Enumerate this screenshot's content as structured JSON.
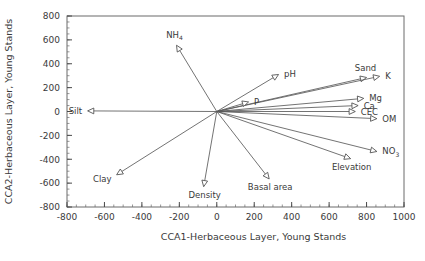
{
  "chart_data": {
    "type": "scatter",
    "title": "",
    "xlabel": "CCA1-Herbaceous Layer, Young Stands",
    "ylabel": "CCA2-Herbaceous Layer, Young Stands",
    "xlim": [
      -800,
      1000
    ],
    "ylim": [
      -800,
      800
    ],
    "xticks": [
      -800,
      -600,
      -400,
      -200,
      0,
      200,
      400,
      600,
      800,
      1000
    ],
    "xticklabels": [
      "-800",
      "-600",
      "-400",
      "-200",
      "0",
      "200",
      "400",
      "600",
      "800",
      "1000"
    ],
    "yticks": [
      -800,
      -600,
      -400,
      -200,
      0,
      200,
      400,
      600,
      800
    ],
    "yticklabels": [
      "-800",
      "-600",
      "-400",
      "-200",
      "0",
      "200",
      "400",
      "600",
      "800"
    ],
    "minor_tick_step": 50,
    "grid": false,
    "legend": null,
    "origin": [
      0,
      0
    ],
    "vectors": [
      {
        "name": "NH4",
        "label": "NH",
        "sublabel": "4",
        "x": -215,
        "y": 555,
        "label_pos": "above-left"
      },
      {
        "name": "pH",
        "label": "pH",
        "sublabel": "",
        "x": 330,
        "y": 310,
        "label_pos": "right"
      },
      {
        "name": "Sand",
        "label": "Sand",
        "sublabel": "",
        "x": 800,
        "y": 285,
        "label_pos": "above"
      },
      {
        "name": "K",
        "label": "K",
        "sublabel": "",
        "x": 870,
        "y": 295,
        "label_pos": "right"
      },
      {
        "name": "Mg",
        "label": "Mg",
        "sublabel": "",
        "x": 785,
        "y": 110,
        "label_pos": "right"
      },
      {
        "name": "Ca",
        "label": "Ca",
        "sublabel": "",
        "x": 755,
        "y": 50,
        "label_pos": "right"
      },
      {
        "name": "CEC",
        "label": "CEC",
        "sublabel": "",
        "x": 740,
        "y": 0,
        "label_pos": "right"
      },
      {
        "name": "OM",
        "label": "OM",
        "sublabel": "",
        "x": 855,
        "y": -60,
        "label_pos": "right"
      },
      {
        "name": "NO3",
        "label": "NO",
        "sublabel": "3",
        "x": 855,
        "y": -335,
        "label_pos": "right"
      },
      {
        "name": "Elevation",
        "label": "Elevation",
        "sublabel": "",
        "x": 715,
        "y": -395,
        "label_pos": "below"
      },
      {
        "name": "P",
        "label": "P",
        "sublabel": "",
        "x": 170,
        "y": 80,
        "label_pos": "right"
      },
      {
        "name": "Silt",
        "label": "Silt",
        "sublabel": "",
        "x": -690,
        "y": 5,
        "label_pos": "left"
      },
      {
        "name": "Clay",
        "label": "Clay",
        "sublabel": "",
        "x": -535,
        "y": -530,
        "label_pos": "below-left"
      },
      {
        "name": "Density",
        "label": "Density",
        "sublabel": "",
        "x": -70,
        "y": -630,
        "label_pos": "below"
      },
      {
        "name": "Basal area",
        "label": "Basal area",
        "sublabel": "",
        "x": 280,
        "y": -565,
        "label_pos": "below"
      }
    ]
  }
}
